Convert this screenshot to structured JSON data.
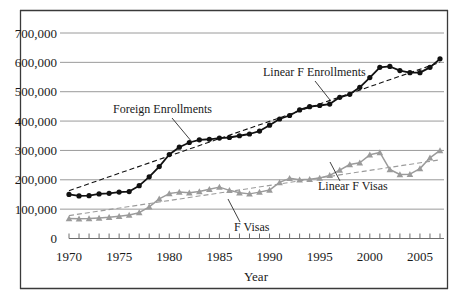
{
  "chart_data": {
    "type": "line",
    "title": "",
    "xlabel": "Year",
    "ylabel": "",
    "xlim": [
      1970,
      2008
    ],
    "ylim": [
      0,
      700000
    ],
    "grid": true,
    "legend_position": "inline-annotations",
    "x_tick_labels": [
      "1970",
      "1975",
      "1980",
      "1985",
      "1990",
      "1995",
      "2000",
      "2005"
    ],
    "x_tick_values": [
      1970,
      1975,
      1980,
      1985,
      1990,
      1995,
      2000,
      2005
    ],
    "y_tick_labels": [
      "0",
      "100,000",
      "200,000",
      "300,000",
      "400,000",
      "500,000",
      "600,000",
      "700,000"
    ],
    "y_tick_values": [
      0,
      100000,
      200000,
      300000,
      400000,
      500000,
      600000,
      700000
    ],
    "x": [
      1970,
      1971,
      1972,
      1973,
      1974,
      1975,
      1976,
      1977,
      1978,
      1979,
      1980,
      1981,
      1982,
      1983,
      1984,
      1985,
      1986,
      1987,
      1988,
      1989,
      1990,
      1991,
      1992,
      1993,
      1994,
      1995,
      1996,
      1997,
      1998,
      1999,
      2000,
      2001,
      2002,
      2003,
      2004,
      2005,
      2006,
      2007
    ],
    "series": [
      {
        "name": "Foreign Enrollments",
        "marker": "circle",
        "color": "#111111",
        "style": "solid",
        "values": [
          150000,
          145000,
          146000,
          152000,
          154000,
          158000,
          160000,
          180000,
          210000,
          245000,
          286000,
          311000,
          327000,
          336000,
          338000,
          342000,
          344000,
          350000,
          356000,
          366000,
          386000,
          407000,
          419000,
          438000,
          449000,
          453000,
          458000,
          481000,
          491000,
          515000,
          548000,
          583000,
          586000,
          572000,
          565000,
          565000,
          583000,
          612000
        ]
      },
      {
        "name": "F Visas",
        "marker": "triangle",
        "color": "#9b9b9b",
        "style": "solid",
        "values": [
          68000,
          67000,
          68000,
          70000,
          72000,
          76000,
          80000,
          88000,
          108000,
          135000,
          153000,
          158000,
          156000,
          160000,
          168000,
          175000,
          164000,
          156000,
          152000,
          158000,
          165000,
          191000,
          205000,
          200000,
          202000,
          206000,
          215000,
          233000,
          252000,
          258000,
          285000,
          293000,
          235000,
          218000,
          219000,
          238000,
          275000,
          300000
        ]
      },
      {
        "name": "Linear F Enrollments",
        "marker": "none",
        "color": "#111111",
        "style": "dashed",
        "trendline": true,
        "endpoints": [
          [
            1970,
            163000
          ],
          [
            2007,
            600000
          ]
        ]
      },
      {
        "name": "Linear F Visas",
        "marker": "none",
        "color": "#9b9b9b",
        "style": "dashed",
        "trendline": true,
        "endpoints": [
          [
            1970,
            78000
          ],
          [
            2007,
            268000
          ]
        ]
      }
    ],
    "annotations": [
      {
        "name": "foreign-enrollments",
        "text": "Foreign Enrollments",
        "text_x": 113,
        "text_y": 113,
        "leader": [
          [
            172,
            118
          ],
          [
            192,
            142
          ]
        ]
      },
      {
        "name": "linear-f-enrollments",
        "text": "Linear F Enrollments",
        "text_x": 263,
        "text_y": 76,
        "leader": [
          [
            315,
            81
          ],
          [
            330,
            100
          ]
        ]
      },
      {
        "name": "f-visas",
        "text": "F Visas",
        "text_x": 234,
        "text_y": 231,
        "leader": [
          [
            240,
            222
          ],
          [
            228,
            199
          ]
        ]
      },
      {
        "name": "linear-f-visas",
        "text": "Linear F Visas",
        "text_x": 318,
        "text_y": 190,
        "leader": [
          [
            340,
            181
          ],
          [
            330,
            162
          ]
        ]
      }
    ]
  },
  "figure": {
    "x_axis_title": "Year",
    "frame_color": "#3a3a3a",
    "grid_color": "#9a9a9a",
    "enrollments_color": "#111111",
    "visas_color": "#9b9b9b"
  }
}
